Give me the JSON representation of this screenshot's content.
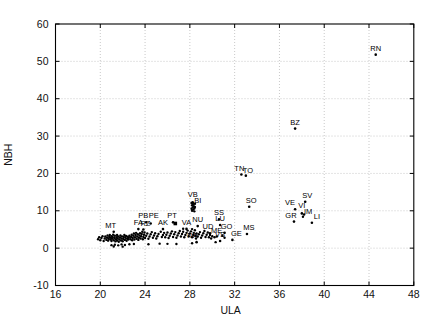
{
  "chart_data": {
    "type": "scatter",
    "xlabel": "ULA",
    "ylabel": "NBH",
    "xlim": [
      16,
      48
    ],
    "ylim": [
      -10,
      60
    ],
    "xticks": [
      16,
      20,
      24,
      28,
      32,
      36,
      40,
      44,
      48
    ],
    "yticks": [
      -10,
      0,
      10,
      20,
      30,
      40,
      50,
      60
    ],
    "grid": true,
    "legend": "none",
    "colors": {
      "marker": "#000000",
      "grid": "#c9c9c9",
      "frame": "#000000",
      "text": "#111111"
    },
    "labeled_points": [
      {
        "t": "RN",
        "x": 44.6,
        "y": 51.8
      },
      {
        "t": "BZ",
        "x": 37.4,
        "y": 32.0
      },
      {
        "t": "TN",
        "x": 32.6,
        "y": 19.7,
        "lx": -2
      },
      {
        "t": "TO",
        "x": 33.0,
        "y": 19.4,
        "lx": 2,
        "ly": 1
      },
      {
        "t": "SO",
        "x": 33.3,
        "y": 11.1,
        "lx": 2
      },
      {
        "t": "SV",
        "x": 38.3,
        "y": 12.4,
        "lx": 2
      },
      {
        "t": "VE",
        "x": 37.4,
        "y": 10.4,
        "lx": -5
      },
      {
        "t": "VI",
        "x": 38.0,
        "y": 9.3,
        "ly": -1
      },
      {
        "t": "IM",
        "x": 38.2,
        "y": 9.0,
        "lx": 4,
        "ly": 3
      },
      {
        "t": "GR",
        "x": 37.3,
        "y": 7.1,
        "lx": -3
      },
      {
        "t": "LI",
        "x": 38.9,
        "y": 6.8,
        "lx": 5
      },
      {
        "t": "MS",
        "x": 33.1,
        "y": 3.8,
        "lx": 2
      },
      {
        "t": "SS",
        "x": 30.6,
        "y": 7.7
      },
      {
        "t": "LU",
        "x": 30.7,
        "y": 6.2
      },
      {
        "t": "UD",
        "x": 29.8,
        "y": 4.0,
        "lx": -2
      },
      {
        "t": "GO",
        "x": 31.1,
        "y": 4.1,
        "lx": 2
      },
      {
        "t": "ME",
        "x": 30.4,
        "y": 3.1
      },
      {
        "t": "VS",
        "x": 30.7,
        "y": 1.9
      },
      {
        "t": "GE",
        "x": 31.8,
        "y": 2.2,
        "lx": 4
      },
      {
        "t": "NA",
        "x": 28.6,
        "y": 1.6,
        "lx": -4
      },
      {
        "t": "NU",
        "x": 28.7,
        "y": 5.9
      },
      {
        "t": "VB",
        "x": 28.25,
        "y": 12.3,
        "ly": -1
      },
      {
        "t": "BI",
        "x": 28.45,
        "y": 11.9,
        "lx": 3,
        "ly": 3
      },
      {
        "t": "VA",
        "x": 27.7,
        "y": 5.15
      },
      {
        "t": "PT",
        "x": 26.5,
        "y": 6.9,
        "lx": -1
      },
      {
        "t": "PB",
        "x": 24.1,
        "y": 6.9,
        "lx": -3
      },
      {
        "t": "PE",
        "x": 24.5,
        "y": 6.6,
        "lx": 3,
        "ly": -1
      },
      {
        "t": "AK",
        "x": 25.6,
        "y": 5.1
      },
      {
        "t": "FA",
        "x": 23.4,
        "y": 5.1
      },
      {
        "t": "RZ",
        "x": 23.85,
        "y": 5.0,
        "lx": 2,
        "ly": 1
      },
      {
        "t": "MT",
        "x": 21.2,
        "y": 4.4,
        "lx": -3
      }
    ],
    "square_point": [
      26.7,
      6.6
    ],
    "unlabeled_points": [
      [
        19.8,
        2.4
      ],
      [
        19.9,
        2.9
      ],
      [
        20.0,
        2.1
      ],
      [
        20.1,
        2.7
      ],
      [
        20.2,
        3.2
      ],
      [
        20.3,
        1.9
      ],
      [
        20.4,
        2.6
      ],
      [
        20.45,
        3.1
      ],
      [
        20.55,
        2.2
      ],
      [
        20.6,
        2.8
      ],
      [
        20.65,
        3.4
      ],
      [
        20.7,
        2.0
      ],
      [
        20.75,
        2.5
      ],
      [
        20.8,
        3.0
      ],
      [
        20.85,
        3.55
      ],
      [
        20.9,
        2.3
      ],
      [
        20.95,
        2.75
      ],
      [
        21.0,
        3.2
      ],
      [
        21.0,
        1.9
      ],
      [
        21.05,
        2.5
      ],
      [
        21.1,
        3.0
      ],
      [
        21.15,
        3.6
      ],
      [
        21.2,
        2.1
      ],
      [
        21.25,
        2.7
      ],
      [
        21.3,
        3.3
      ],
      [
        21.35,
        1.8
      ],
      [
        21.4,
        2.4
      ],
      [
        21.45,
        2.9
      ],
      [
        21.5,
        3.5
      ],
      [
        21.5,
        2.0
      ],
      [
        21.55,
        2.6
      ],
      [
        21.6,
        3.1
      ],
      [
        21.65,
        1.7
      ],
      [
        21.7,
        2.3
      ],
      [
        21.75,
        2.85
      ],
      [
        21.8,
        3.4
      ],
      [
        21.85,
        2.05
      ],
      [
        21.9,
        2.6
      ],
      [
        21.95,
        3.15
      ],
      [
        22.0,
        1.85
      ],
      [
        22.05,
        2.45
      ],
      [
        22.1,
        3.0
      ],
      [
        22.15,
        3.5
      ],
      [
        22.2,
        2.2
      ],
      [
        22.25,
        2.75
      ],
      [
        22.3,
        3.25
      ],
      [
        22.35,
        1.95
      ],
      [
        22.4,
        2.5
      ],
      [
        22.45,
        3.05
      ],
      [
        22.5,
        2.3
      ],
      [
        22.55,
        2.8
      ],
      [
        22.6,
        3.3
      ],
      [
        21.0,
        0.8
      ],
      [
        21.2,
        0.45
      ],
      [
        21.3,
        0.9
      ],
      [
        21.6,
        0.75
      ],
      [
        21.9,
        1.0
      ],
      [
        22.0,
        0.4
      ],
      [
        22.2,
        0.85
      ],
      [
        22.6,
        1.05
      ],
      [
        23.0,
        1.1
      ],
      [
        24.3,
        1.05
      ],
      [
        25.3,
        1.2
      ],
      [
        26.0,
        1.15
      ],
      [
        26.8,
        1.1
      ],
      [
        28.2,
        1.3
      ],
      [
        22.7,
        2.4
      ],
      [
        22.75,
        3.0
      ],
      [
        22.8,
        3.6
      ],
      [
        22.85,
        2.1
      ],
      [
        22.9,
        2.7
      ],
      [
        22.95,
        3.3
      ],
      [
        23.0,
        3.9
      ],
      [
        23.05,
        2.3
      ],
      [
        23.1,
        2.9
      ],
      [
        23.15,
        3.5
      ],
      [
        23.2,
        4.1
      ],
      [
        23.25,
        2.5
      ],
      [
        23.3,
        3.1
      ],
      [
        23.35,
        3.7
      ],
      [
        23.4,
        2.2
      ],
      [
        23.45,
        2.8
      ],
      [
        23.5,
        3.4
      ],
      [
        23.55,
        4.0
      ],
      [
        23.6,
        2.6
      ],
      [
        23.65,
        3.2
      ],
      [
        23.7,
        3.8
      ],
      [
        23.75,
        4.4
      ],
      [
        23.8,
        2.4
      ],
      [
        23.85,
        3.0
      ],
      [
        23.9,
        3.6
      ],
      [
        23.95,
        4.2
      ],
      [
        24.0,
        2.7
      ],
      [
        24.1,
        3.3
      ],
      [
        24.2,
        3.9
      ],
      [
        24.3,
        2.5
      ],
      [
        24.4,
        3.1
      ],
      [
        24.5,
        3.7
      ],
      [
        24.6,
        4.3
      ],
      [
        24.7,
        2.8
      ],
      [
        24.8,
        3.4
      ],
      [
        24.9,
        4.0
      ],
      [
        25.0,
        2.6
      ],
      [
        25.1,
        3.2
      ],
      [
        25.2,
        3.8
      ],
      [
        25.4,
        4.4
      ],
      [
        25.5,
        3.0
      ],
      [
        25.6,
        3.5
      ],
      [
        25.7,
        4.1
      ],
      [
        25.8,
        2.9
      ],
      [
        25.9,
        3.6
      ],
      [
        26.0,
        4.2
      ],
      [
        26.1,
        2.7
      ],
      [
        26.2,
        3.3
      ],
      [
        26.3,
        3.9
      ],
      [
        26.4,
        4.5
      ],
      [
        26.5,
        3.0
      ],
      [
        26.6,
        3.7
      ],
      [
        26.7,
        4.3
      ],
      [
        26.8,
        2.8
      ],
      [
        26.9,
        3.4
      ],
      [
        27.0,
        4.0
      ],
      [
        27.1,
        4.6
      ],
      [
        27.2,
        3.1
      ],
      [
        27.3,
        3.8
      ],
      [
        27.4,
        4.4
      ],
      [
        27.5,
        2.9
      ],
      [
        27.6,
        3.5
      ],
      [
        27.7,
        4.1
      ],
      [
        27.8,
        4.7
      ],
      [
        27.9,
        3.2
      ],
      [
        28.0,
        3.9
      ],
      [
        28.1,
        4.5
      ],
      [
        28.2,
        2.9
      ],
      [
        28.3,
        3.5
      ],
      [
        28.35,
        4.1
      ],
      [
        28.45,
        4.8
      ],
      [
        28.5,
        3.3
      ],
      [
        28.55,
        2.6
      ],
      [
        28.6,
        3.9
      ],
      [
        28.2,
        5.1
      ],
      [
        27.4,
        5.2
      ],
      [
        28.7,
        3.1
      ],
      [
        28.8,
        3.7
      ],
      [
        28.9,
        4.3
      ],
      [
        29.0,
        2.8
      ],
      [
        29.1,
        3.4
      ],
      [
        29.2,
        4.0
      ],
      [
        29.3,
        4.6
      ],
      [
        29.4,
        3.0
      ],
      [
        29.5,
        3.6
      ],
      [
        29.6,
        4.2
      ],
      [
        29.7,
        2.9
      ],
      [
        29.8,
        3.5
      ],
      [
        29.9,
        2.6
      ],
      [
        30.0,
        3.2
      ],
      [
        30.2,
        2.9
      ],
      [
        30.9,
        3.3
      ],
      [
        31.1,
        2.8
      ],
      [
        30.3,
        1.6
      ],
      [
        28.15,
        12.1
      ],
      [
        28.3,
        11.8
      ],
      [
        28.2,
        11.5
      ],
      [
        28.35,
        11.2
      ],
      [
        28.25,
        10.9
      ],
      [
        28.4,
        10.6
      ],
      [
        28.3,
        10.3
      ],
      [
        28.2,
        10.0
      ],
      [
        28.45,
        11.0
      ],
      [
        28.3,
        11.95
      ],
      [
        28.15,
        10.55
      ],
      [
        28.4,
        9.85
      ],
      [
        38.1,
        8.4
      ]
    ]
  }
}
